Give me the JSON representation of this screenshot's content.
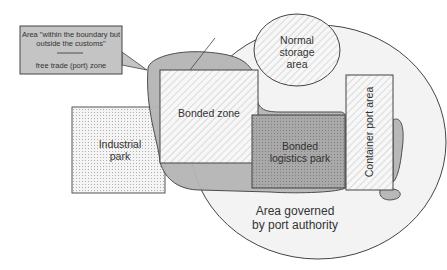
{
  "diagram": {
    "callout": {
      "line1": "Area \"within the boundary but",
      "line2": "outside the customs\"",
      "line3": "free trade (port) zone"
    },
    "regions": {
      "normal_storage": {
        "line1": "Normal",
        "line2": "storage",
        "line3": "area"
      },
      "bonded_zone": {
        "label": "Bonded zone"
      },
      "industrial_park": {
        "line1": "Industrial",
        "line2": "park"
      },
      "bonded_logistics": {
        "line1": "Bonded",
        "line2": "logistics park"
      },
      "container_port": {
        "label": "Container port area"
      },
      "port_authority": {
        "line1": "Area governed",
        "line2": "by port authority"
      }
    },
    "colors": {
      "outline": "#444444",
      "free_zone_fill": "#b5b5b5",
      "circle_fill": "#f3f3f3",
      "logistics_fill": "#a8a8a8",
      "callout_fill": "#c4c4c4"
    }
  }
}
